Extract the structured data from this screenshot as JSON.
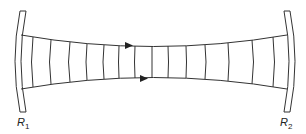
{
  "diagram": {
    "type": "optical-resonator",
    "colors": {
      "line": "#333333",
      "background": "#ffffff"
    },
    "mirrors": [
      {
        "id": "left",
        "label": "R",
        "subscript": "1"
      },
      {
        "id": "right",
        "label": "R",
        "subscript": "2"
      }
    ],
    "wavefront_count": 14,
    "arrows": 2
  }
}
